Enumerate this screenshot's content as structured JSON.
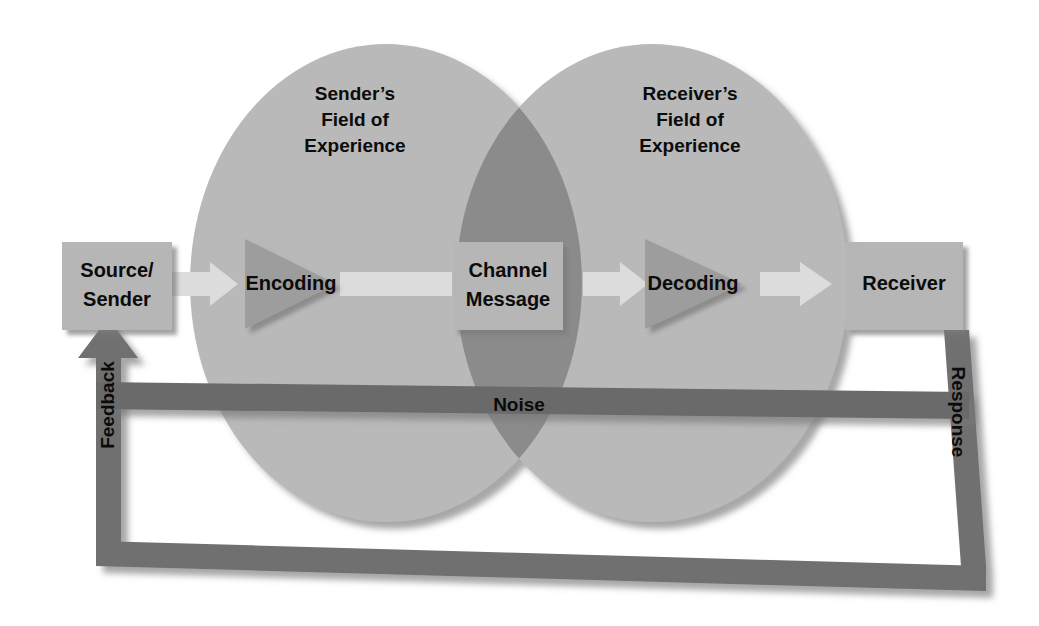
{
  "diagram": {
    "background_color": "#ffffff",
    "fields": [
      {
        "id": "sender-field",
        "line1": "Sender’s",
        "line2": "Field of",
        "line3": "Experience"
      },
      {
        "id": "receiver-field",
        "line1": "Receiver’s",
        "line2": "Field of",
        "line3": "Experience"
      }
    ],
    "nodes": [
      {
        "id": "source-sender",
        "shape": "box",
        "line1": "Source/",
        "line2": "Sender"
      },
      {
        "id": "encoding",
        "shape": "triangle",
        "line1": "Encoding",
        "line2": ""
      },
      {
        "id": "channel-message",
        "shape": "box",
        "line1": "Channel",
        "line2": "Message"
      },
      {
        "id": "decoding",
        "shape": "triangle",
        "line1": "Decoding",
        "line2": ""
      },
      {
        "id": "receiver",
        "shape": "box",
        "line1": "Receiver",
        "line2": ""
      }
    ],
    "noise": {
      "id": "noise-bar",
      "label": "Noise"
    },
    "loop": [
      {
        "id": "feedback",
        "label": "Feedback",
        "direction": "up-left"
      },
      {
        "id": "response",
        "label": "Response",
        "direction": "down-right"
      }
    ],
    "colors": {
      "circle_fill": "#b9b9b9",
      "circle_overlap": "#8b8b8b",
      "box_fill": "#b6b6b6",
      "triangle_fill": "#9d9d9d",
      "flow_arrow": "#dcdcdc",
      "noise_bar": "#6a6a6a",
      "loop_bar": "#6f6f6f",
      "text": "#0b0b0b",
      "shadow": "#8e8e8e"
    }
  }
}
